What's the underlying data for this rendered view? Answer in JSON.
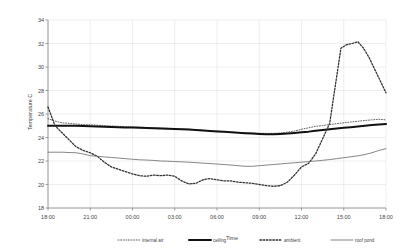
{
  "chart_data": {
    "type": "line",
    "title": "",
    "xlabel": "Time",
    "ylabel": "Temperature C",
    "ylim": [
      18,
      34
    ],
    "ytick_step": 2,
    "yticks": [
      "18",
      "20",
      "22",
      "24",
      "26",
      "28",
      "30",
      "32",
      "34"
    ],
    "xticks": [
      "18:00",
      "21:00",
      "00:00",
      "03:00",
      "06:00",
      "09:00",
      "12:00",
      "15:00",
      "18:00"
    ],
    "x_hours": [
      0,
      3,
      6,
      9,
      12,
      15,
      18,
      21,
      24
    ],
    "xlim_hours": [
      0,
      24
    ],
    "grid": true,
    "legend_position": "bottom",
    "colors": {
      "internal_air": "#555555",
      "ceiling": "#111111",
      "ambient": "#333333",
      "roof_pond": "#666666",
      "grid": "#dcdcdc",
      "axis": "#888888",
      "background": "#ffffff"
    },
    "x": [
      0,
      0.5,
      1,
      1.5,
      2,
      2.5,
      3,
      3.5,
      4,
      4.5,
      5,
      5.5,
      6,
      6.5,
      7,
      7.5,
      8,
      8.5,
      9,
      9.5,
      10,
      10.5,
      11,
      11.5,
      12,
      12.5,
      13,
      13.5,
      14,
      14.5,
      15,
      15.5,
      16,
      16.5,
      17,
      17.5,
      18,
      18.5,
      19,
      19.5,
      20,
      20.5,
      21,
      21.5,
      22,
      22.5,
      23,
      23.5,
      24
    ],
    "series": [
      {
        "name": "internal air",
        "style": "dotted",
        "values": [
          25.6,
          25.4,
          25.25,
          25.2,
          25.15,
          25.1,
          25.08,
          25.05,
          25.0,
          24.98,
          24.95,
          24.92,
          24.9,
          24.88,
          24.85,
          24.82,
          24.8,
          24.78,
          24.75,
          24.72,
          24.7,
          24.66,
          24.62,
          24.58,
          24.55,
          24.5,
          24.45,
          24.42,
          24.4,
          24.38,
          24.36,
          24.35,
          24.35,
          24.38,
          24.45,
          24.55,
          24.7,
          24.82,
          24.95,
          25.02,
          25.1,
          25.18,
          25.25,
          25.32,
          25.38,
          25.45,
          25.5,
          25.55,
          25.5
        ]
      },
      {
        "name": "ceiling",
        "style": "solid-thick",
        "values": [
          25.0,
          25.0,
          25.0,
          25.0,
          25.0,
          24.98,
          24.96,
          24.94,
          24.92,
          24.9,
          24.88,
          24.86,
          24.85,
          24.83,
          24.81,
          24.79,
          24.77,
          24.75,
          24.72,
          24.7,
          24.68,
          24.64,
          24.6,
          24.56,
          24.52,
          24.48,
          24.44,
          24.4,
          24.36,
          24.33,
          24.3,
          24.28,
          24.28,
          24.3,
          24.33,
          24.38,
          24.44,
          24.5,
          24.58,
          24.64,
          24.7,
          24.76,
          24.82,
          24.88,
          24.94,
          25.0,
          25.06,
          25.1,
          25.15
        ]
      },
      {
        "name": "ambient",
        "style": "dashed-dot",
        "values": [
          26.6,
          25.0,
          24.4,
          23.8,
          23.2,
          22.9,
          22.7,
          22.4,
          21.9,
          21.5,
          21.3,
          21.1,
          20.9,
          20.75,
          20.7,
          20.8,
          20.75,
          20.8,
          20.7,
          20.3,
          20.05,
          20.1,
          20.4,
          20.5,
          20.4,
          20.3,
          20.3,
          20.2,
          20.15,
          20.1,
          20.0,
          19.9,
          19.85,
          19.9,
          20.2,
          20.8,
          21.5,
          21.8,
          22.6,
          23.9,
          25.2,
          26.6,
          27.9,
          28.7,
          29.0,
          29.9,
          30.6,
          31.1,
          31.4
        ]
      },
      {
        "name": "roof pond",
        "style": "solid-thin",
        "values": [
          22.75,
          22.75,
          22.75,
          22.72,
          22.7,
          22.6,
          22.45,
          22.4,
          22.35,
          22.3,
          22.25,
          22.2,
          22.15,
          22.1,
          22.08,
          22.05,
          22.0,
          21.98,
          21.95,
          21.93,
          21.9,
          21.86,
          21.82,
          21.78,
          21.74,
          21.7,
          21.65,
          21.6,
          21.55,
          21.55,
          21.6,
          21.65,
          21.7,
          21.75,
          21.8,
          21.85,
          21.9,
          21.95,
          22.0,
          22.06,
          22.12,
          22.2,
          22.28,
          22.36,
          22.44,
          22.55,
          22.7,
          22.9,
          23.05
        ]
      }
    ],
    "ambient_tail": {
      "note": "ambient continues past 24h grid in image; peak then falls",
      "x": [
        20.8,
        21.2,
        21.6,
        22.0,
        22.4,
        22.8,
        23.2,
        23.6,
        24.0
      ],
      "values": [
        31.6,
        31.9,
        32.0,
        32.15,
        31.6,
        30.8,
        29.8,
        28.8,
        27.8
      ]
    }
  },
  "legend": {
    "items": [
      {
        "label": "internal air",
        "key": "internal_air"
      },
      {
        "label": "ceiling",
        "key": "ceiling"
      },
      {
        "label": "ambient",
        "key": "ambient"
      },
      {
        "label": "roof pond",
        "key": "roof_pond"
      }
    ]
  }
}
